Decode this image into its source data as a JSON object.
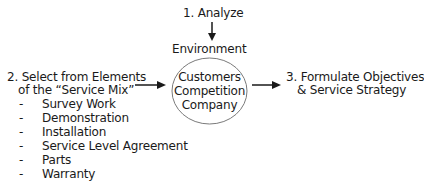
{
  "diagram": {
    "step1": {
      "label": "1. Analyze",
      "target": "Environment"
    },
    "step2": {
      "line1": "2. Select from Elements",
      "line2": "of the “Service Mix”",
      "items": [
        {
          "bullet": "-",
          "label": "Survey Work"
        },
        {
          "bullet": "-",
          "label": "Demonstration"
        },
        {
          "bullet": "-",
          "label": "Installation"
        },
        {
          "bullet": "-",
          "label": "Service Level Agreement"
        },
        {
          "bullet": "-",
          "label": "Parts"
        },
        {
          "bullet": "-",
          "label": "Warranty"
        }
      ]
    },
    "center": {
      "line1": "Customers",
      "line2": "Competition",
      "line3": "Company"
    },
    "step3": {
      "line1": "3. Formulate Objectives",
      "line2": "& Service Strategy"
    },
    "colors": {
      "text": "#1a1a1a",
      "circle_stroke": "#7a7a7a",
      "arrow": "#1a1a1a"
    }
  }
}
